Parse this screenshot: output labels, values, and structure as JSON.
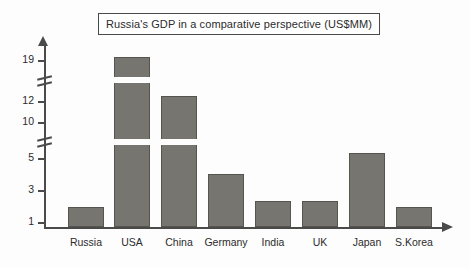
{
  "chart_data": {
    "type": "bar",
    "title": "Russia's GDP in a comparative perspective (US$MM)",
    "xlabel": "",
    "ylabel": "",
    "categories": [
      "Russia",
      "USA",
      "China",
      "Germany",
      "India",
      "UK",
      "Japan",
      "S.Korea"
    ],
    "values": [
      2,
      19,
      12,
      4,
      2.5,
      2.5,
      5.5,
      2
    ],
    "ytick_labels": [
      "19",
      "12",
      "10",
      "5",
      "3",
      "1"
    ],
    "ytick_values": [
      19,
      12,
      10,
      5,
      3,
      1
    ],
    "axis_breaks": [
      {
        "between": "19 and 12"
      },
      {
        "between": "10 and 5"
      }
    ],
    "grid": false,
    "legend": "none",
    "bar_color": "#767570",
    "axis_color": "#4a4a4a",
    "text_color": "#2b2b2b"
  },
  "axis": {
    "y_ticks": [
      {
        "label": "19",
        "top": 60
      },
      {
        "label": "12",
        "top": 101
      },
      {
        "label": "10",
        "top": 122
      },
      {
        "label": "5",
        "top": 158
      },
      {
        "label": "3",
        "top": 190
      },
      {
        "label": "1",
        "top": 222
      }
    ],
    "breaks": [
      {
        "top": 76
      },
      {
        "top": 137
      }
    ]
  },
  "bars": [
    {
      "name": "Russia",
      "label": "Russia",
      "left": 68,
      "width": 36,
      "top": 207,
      "center": 86,
      "gaps": []
    },
    {
      "name": "USA",
      "label": "USA",
      "left": 114,
      "width": 36,
      "top": 57,
      "center": 132,
      "gaps": [
        {
          "top": 77,
          "height": 6
        },
        {
          "top": 139,
          "height": 6
        }
      ]
    },
    {
      "name": "China",
      "label": "China",
      "left": 161,
      "width": 36,
      "top": 96,
      "center": 179,
      "gaps": [
        {
          "top": 139,
          "height": 6
        }
      ]
    },
    {
      "name": "Germany",
      "label": "Germany",
      "left": 208,
      "width": 36,
      "top": 174,
      "center": 226,
      "gaps": []
    },
    {
      "name": "India",
      "label": "India",
      "left": 255,
      "width": 36,
      "top": 201,
      "center": 273,
      "gaps": []
    },
    {
      "name": "UK",
      "label": "UK",
      "left": 302,
      "width": 36,
      "top": 201,
      "center": 320,
      "gaps": []
    },
    {
      "name": "Japan",
      "label": "Japan",
      "left": 349,
      "width": 36,
      "top": 153,
      "center": 367,
      "gaps": []
    },
    {
      "name": "SKorea",
      "label": "S.Korea",
      "left": 396,
      "width": 36,
      "top": 207,
      "center": 414,
      "gaps": []
    }
  ]
}
